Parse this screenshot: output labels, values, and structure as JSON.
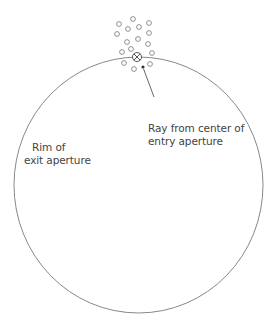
{
  "diagram": {
    "labels": {
      "rim_line1": "Rim of",
      "rim_line2": "exit aperture",
      "ray_line1": "Ray from center of",
      "ray_line2": "entry aperture"
    },
    "colors": {
      "stroke": "#888888",
      "text": "#444444",
      "background": "#ffffff"
    },
    "exit_aperture": {
      "cx": 138.5,
      "cy": 185,
      "rx": 124.5,
      "ry": 128
    },
    "entry_center_marker": {
      "cx": 137,
      "cy": 57,
      "r": 4.5,
      "type": "crossed-circle"
    },
    "ray_point": {
      "x": 143,
      "y": 67
    },
    "scatter_points": [
      [
        119,
        24
      ],
      [
        133,
        19
      ],
      [
        149,
        23
      ],
      [
        128,
        29
      ],
      [
        139,
        27
      ],
      [
        149,
        33
      ],
      [
        117,
        34
      ],
      [
        127,
        42
      ],
      [
        138,
        39
      ],
      [
        148,
        44
      ],
      [
        122,
        52
      ],
      [
        131,
        49
      ],
      [
        152,
        53
      ],
      [
        124,
        63
      ],
      [
        134,
        69
      ],
      [
        150,
        64
      ]
    ]
  }
}
